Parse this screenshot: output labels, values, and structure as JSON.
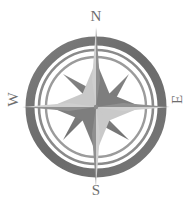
{
  "figure": {
    "name": "compass-rose",
    "background_color": "#ffffff"
  },
  "cardinals": {
    "north": "N",
    "south": "S",
    "east": "E",
    "west": "W"
  },
  "colors": {
    "ring_dark": "#6e6e6e",
    "ring_mid": "#8a8a8a",
    "ring_light": "#a8a8a8",
    "star_dark": "#7a7a7a",
    "star_light": "#c9c9c9",
    "needle_dark": "#8f8f8f",
    "needle_light": "#cfcfcf",
    "label": "#6e6e6e"
  },
  "geometry": {
    "center_x": 96,
    "center_y": 107,
    "outer_ring_radius": 70,
    "outer_ring_width": 9,
    "mid_ring_radius": 58,
    "mid_ring_width": 3,
    "inner_ring_radius": 50,
    "inner_ring_width": 3,
    "star_outer_radius": 46,
    "star_inner_radius": 14,
    "needle_length": 92,
    "points": 8
  }
}
